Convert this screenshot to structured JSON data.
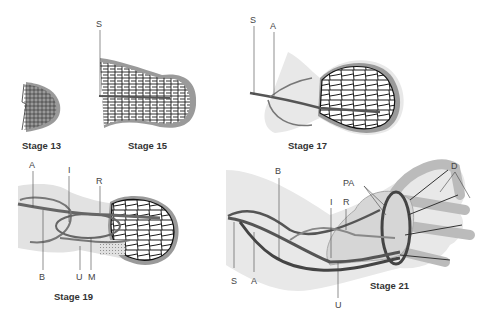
{
  "figure": {
    "colors": {
      "vessel_dark": "#3a3a3a",
      "vessel_mid": "#6a6a6a",
      "limb_fill": "#e6e6e6",
      "limb_shadow": "#cfcfcf",
      "rim": "#9a9a9a",
      "background": "#ffffff"
    },
    "panels": [
      {
        "id": "stage13",
        "label": "Stage 13",
        "markers": []
      },
      {
        "id": "stage15",
        "label": "Stage 15",
        "markers": [
          "S"
        ]
      },
      {
        "id": "stage17",
        "label": "Stage 17",
        "markers": [
          "S",
          "A"
        ]
      },
      {
        "id": "stage19",
        "label": "Stage 19",
        "markers": [
          "A",
          "I",
          "R",
          "B",
          "U",
          "M"
        ]
      },
      {
        "id": "stage21",
        "label": "Stage 21",
        "markers": [
          "B",
          "PA",
          "D",
          "I",
          "R",
          "S",
          "A",
          "U"
        ]
      }
    ]
  }
}
